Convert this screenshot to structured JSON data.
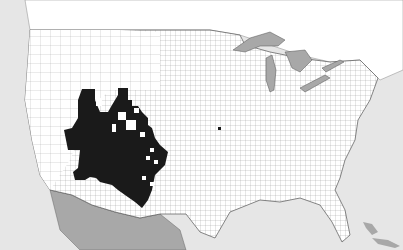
{
  "map": {
    "type": "county distribution map",
    "region": "United States, southern Canada, northern Mexico",
    "colors": {
      "ocean": "#e6e6e6",
      "land": "#ffffff",
      "mexico_canada_shade": "#a8a8a8",
      "present_counties": "#1a1a1a",
      "great_lakes": "#a8a8a8",
      "borders": "#555555"
    },
    "legend": {
      "present": "black-filled counties",
      "absent": "white counties"
    },
    "notes": "Black shading covers Arizona, New Mexico, western Texas, southern Colorado, Oklahoma panhandle, and southwestern Kansas, with scattered absent counties; one outlier county in eastern Kansas/Missouri."
  }
}
